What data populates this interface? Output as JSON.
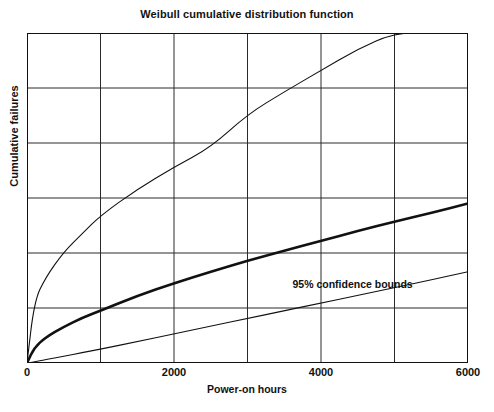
{
  "chart_data": {
    "type": "line",
    "title": "Weibull cumulative distribution function",
    "xlabel": "Power-on hours",
    "ylabel": "Cumulative failures",
    "xlim": [
      0,
      6000
    ],
    "ylim": [
      0,
      6
    ],
    "grid": true,
    "x_ticks": [
      0,
      2000,
      4000,
      6000
    ],
    "x_tick_labels": [
      "0",
      "2000",
      "4000",
      "6000"
    ],
    "x_gridlines": [
      0,
      1000,
      2000,
      3000,
      4000,
      5000,
      6000
    ],
    "y_ticks": [
      0,
      1,
      2,
      3,
      4,
      5,
      6
    ],
    "y_tick_labels": [
      "",
      "",
      "",
      "",
      "",
      "",
      ""
    ],
    "legend": "none",
    "annotations": [
      {
        "text": "95% confidence bounds",
        "x": 4430,
        "y": 1.42
      }
    ],
    "x": [
      0,
      100,
      250,
      500,
      750,
      1000,
      1500,
      2000,
      2500,
      3000,
      3500,
      4000,
      4500,
      5000,
      5500,
      6000
    ],
    "series": [
      {
        "name": "Upper 95% confidence bound",
        "style": "thin",
        "color": "#111111",
        "values": [
          0.0,
          1.12,
          1.55,
          2.02,
          2.35,
          2.68,
          3.16,
          3.56,
          3.92,
          4.52,
          4.93,
          5.32,
          5.71,
          6.0,
          6.0,
          6.0
        ]
      },
      {
        "name": "Weibull CDF fit",
        "style": "thick",
        "color": "#111111",
        "values": [
          0.0,
          0.28,
          0.46,
          0.66,
          0.82,
          0.95,
          1.22,
          1.45,
          1.66,
          1.86,
          2.04,
          2.22,
          2.4,
          2.57,
          2.73,
          2.9
        ]
      },
      {
        "name": "Lower 95% confidence bound",
        "style": "thin",
        "color": "#111111",
        "values": [
          0.0,
          0.02,
          0.06,
          0.12,
          0.19,
          0.25,
          0.39,
          0.53,
          0.67,
          0.81,
          0.95,
          1.09,
          1.23,
          1.37,
          1.51,
          1.66
        ]
      }
    ]
  }
}
